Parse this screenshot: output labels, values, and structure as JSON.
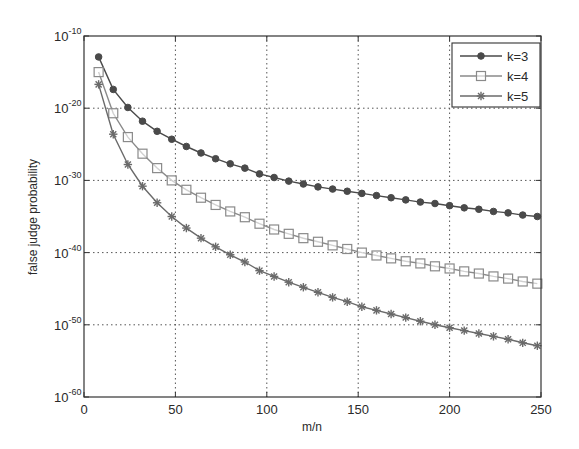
{
  "chart_data": {
    "type": "line",
    "title": "",
    "xlabel": "m/n",
    "ylabel": "false judge probability",
    "yscale": "log",
    "xlim": [
      0,
      250
    ],
    "ylim_log10": [
      -60,
      -10
    ],
    "xticks": [
      0,
      50,
      100,
      150,
      200,
      250
    ],
    "xtick_labels": [
      "0",
      "50",
      "100",
      "150",
      "200",
      "250"
    ],
    "yticks_log10": [
      -10,
      -20,
      -30,
      -40,
      -50,
      -60
    ],
    "ytick_labels": [
      "10^-10",
      "10^-20",
      "10^-30",
      "10^-40",
      "10^-50",
      "10^-60"
    ],
    "grid": true,
    "legend_position": "upper right",
    "x": [
      8,
      16,
      24,
      32,
      40,
      48,
      56,
      64,
      72,
      80,
      88,
      96,
      104,
      112,
      120,
      128,
      136,
      144,
      152,
      160,
      168,
      176,
      184,
      192,
      200,
      208,
      216,
      224,
      232,
      240,
      248
    ],
    "series": [
      {
        "name": "k=3",
        "marker": "filled-circle",
        "color": "#4a4a4a",
        "log10_values": [
          -12.9,
          -17.4,
          -19.9,
          -21.8,
          -23.2,
          -24.3,
          -25.3,
          -26.2,
          -27.0,
          -27.7,
          -28.3,
          -29.1,
          -29.6,
          -30.1,
          -30.5,
          -30.9,
          -31.2,
          -31.5,
          -31.8,
          -32.1,
          -32.4,
          -32.7,
          -33.0,
          -33.2,
          -33.5,
          -33.8,
          -34.0,
          -34.3,
          -34.5,
          -34.8,
          -35.0
        ]
      },
      {
        "name": "k=4",
        "marker": "open-square",
        "color": "#8a8a8a",
        "log10_values": [
          -15.0,
          -20.7,
          -24.0,
          -26.3,
          -28.3,
          -30.0,
          -31.3,
          -32.4,
          -33.4,
          -34.3,
          -35.1,
          -36.0,
          -36.8,
          -37.4,
          -38.0,
          -38.5,
          -39.0,
          -39.5,
          -40.0,
          -40.4,
          -40.8,
          -41.2,
          -41.5,
          -41.9,
          -42.2,
          -42.6,
          -42.9,
          -43.3,
          -43.6,
          -44.0,
          -44.3
        ]
      },
      {
        "name": "k=5",
        "marker": "asterisk",
        "color": "#6a6a6a",
        "log10_values": [
          -16.7,
          -23.6,
          -27.8,
          -30.8,
          -33.1,
          -35.0,
          -36.6,
          -38.0,
          -39.2,
          -40.3,
          -41.3,
          -42.5,
          -43.3,
          -44.1,
          -44.8,
          -45.5,
          -46.2,
          -46.8,
          -47.5,
          -48.0,
          -48.5,
          -49.0,
          -49.5,
          -50.0,
          -50.4,
          -50.8,
          -51.2,
          -51.6,
          -52.0,
          -52.5,
          -52.9
        ]
      }
    ]
  }
}
